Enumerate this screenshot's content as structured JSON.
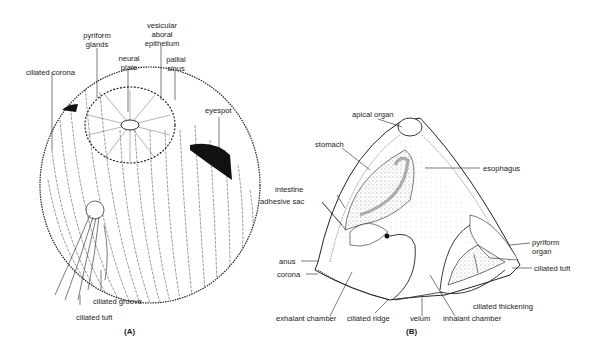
{
  "figure": {
    "panel_a": {
      "caption": "(A)",
      "labels": {
        "pyriform_glands": [
          "pyriform",
          "glands"
        ],
        "vesicular_aboral_epithelium": [
          "vesicular",
          "aboral",
          "epithelium"
        ],
        "neural_plate": [
          "neural",
          "plate"
        ],
        "pallial_sinus": [
          "pallial",
          "sinus"
        ],
        "ciliated_corona": "ciliated corona",
        "eyespot": "eyespot",
        "ciliated_groove": "ciliated groove",
        "ciliated_tuft": "ciliated tuft"
      }
    },
    "panel_b": {
      "caption": "(B)",
      "labels": {
        "apical_organ": "apical organ",
        "stomach": "stomach",
        "esophagus": "esophagus",
        "intestine": "intestine",
        "adhesive_sac": "adhesive sac",
        "anus": "anus",
        "corona": "corona",
        "pyriform_organ": [
          "pyriform",
          "organ"
        ],
        "ciliated_tuft": "ciliated tuft",
        "ciliated_thickening": "ciliated thickening",
        "exhalant_chamber": "exhalant chamber",
        "ciliated_ridge": "ciliated ridge",
        "velum": "velum",
        "inhalant_chamber": "inhalant chamber"
      }
    }
  }
}
